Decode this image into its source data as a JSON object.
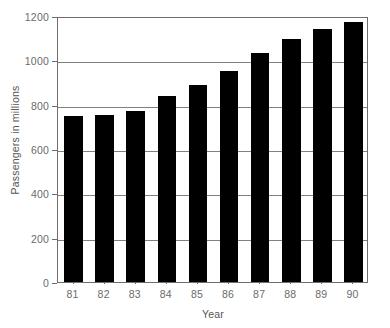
{
  "chart_data": {
    "type": "bar",
    "title": "",
    "xlabel": "Year",
    "ylabel": "Passengers in millions",
    "categories": [
      "81",
      "82",
      "83",
      "84",
      "85",
      "86",
      "87",
      "88",
      "89",
      "90"
    ],
    "values": [
      750,
      752,
      770,
      838,
      890,
      950,
      1035,
      1095,
      1143,
      1175
    ],
    "ylim": [
      0,
      1200
    ],
    "xlim_categories": 10,
    "y_ticks": [
      0,
      200,
      400,
      600,
      800,
      1000,
      1200
    ],
    "y_tick_labels": [
      "0",
      "200",
      "400",
      "600",
      "800",
      "1000",
      "1200"
    ],
    "grid": true,
    "grid_axis": "y",
    "legend": null,
    "legend_position": "none",
    "series": [
      {
        "name": "Passengers",
        "values": [
          750,
          752,
          770,
          838,
          890,
          950,
          1035,
          1095,
          1143,
          1175
        ]
      }
    ],
    "colors": {
      "bar_fill": "#000000",
      "gridline": "#808080",
      "axis": "#6e6e6e",
      "tick_label": "#6b6b6b",
      "axis_title": "#555555",
      "background": "#ffffff"
    },
    "annotations": []
  }
}
